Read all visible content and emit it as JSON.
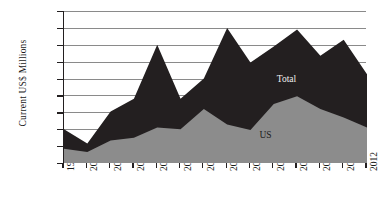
{
  "chart_data": {
    "type": "area",
    "stacked": true,
    "title": "",
    "xlabel": "",
    "ylabel": "Current US$ Millions",
    "ylim": [
      0,
      1800
    ],
    "ytick_step": 200,
    "grid": true,
    "legend": "inline-annotations",
    "categories": [
      "1999",
      "2000",
      "2001",
      "2002",
      "2003",
      "2004",
      "2005",
      "2006",
      "2007",
      "2008",
      "2009",
      "2010",
      "2011",
      "2012"
    ],
    "series": [
      {
        "name": "US",
        "color": "#8c8c8c",
        "values": [
          170,
          130,
          265,
          300,
          420,
          400,
          640,
          455,
          390,
          700,
          790,
          640,
          540,
          420
        ]
      },
      {
        "name": "Total",
        "color": "#231f20",
        "values": [
          400,
          230,
          610,
          760,
          1400,
          760,
          1000,
          1600,
          1190,
          1380,
          1580,
          1270,
          1460,
          1050
        ]
      }
    ],
    "annotations": [
      {
        "text": "Total",
        "series": "Total"
      },
      {
        "text": "US",
        "series": "US"
      }
    ]
  },
  "axis": {
    "y_ticks": [
      "1800",
      "1600",
      "1400",
      "1200",
      "1000",
      "800",
      "600",
      "400",
      "200",
      "0"
    ],
    "x_ticks": [
      "1999",
      "2000",
      "2001",
      "2002",
      "2003",
      "2004",
      "2005",
      "2006",
      "2007",
      "2008",
      "2009",
      "2010",
      "2011",
      "2012"
    ],
    "y_title": "Current US$ Millions"
  },
  "colors": {
    "us_area": "#8c8c8c",
    "total_area": "#231f20",
    "gridline": "#8a8a8a",
    "axis": "#231f20",
    "background": "#ffffff"
  }
}
